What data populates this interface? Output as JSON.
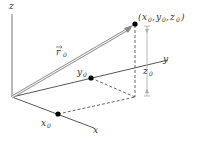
{
  "diagram": {
    "axes": {
      "x_label": "x",
      "y_label": "y",
      "z_label": "z"
    },
    "vector_label": "r⃗0",
    "vector_label_main": "r",
    "vector_label_sub": "0",
    "point_label": "(x0, y0, z0)",
    "point_parts": {
      "open": "(",
      "x": "x",
      "y": "y",
      "z": "z",
      "sub": "0",
      "close": ")"
    },
    "x0_label": {
      "main": "x",
      "sub": "0"
    },
    "y0_label": {
      "main": "y",
      "sub": "0"
    },
    "z0_label": {
      "main": "z",
      "sub": "0"
    },
    "colors": {
      "axis": "#555555",
      "vector": "#888888",
      "dashed": "#555555",
      "dimension": "#999999",
      "point": "#000000"
    }
  }
}
